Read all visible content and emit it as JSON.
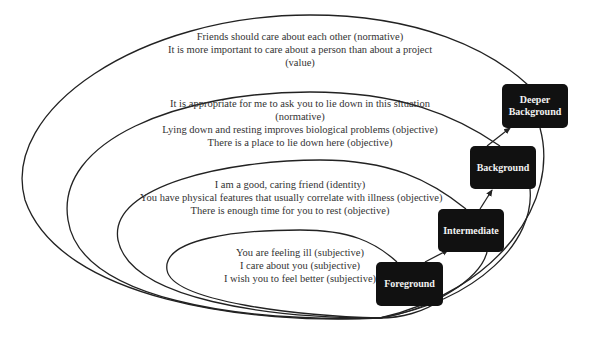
{
  "levels": [
    {
      "name": "Deeper Background",
      "label": "Deeper\nBackground",
      "label_line1": "Deeper",
      "label_line2": "Background",
      "statements": [
        "Friends should care about each other (normative)",
        "It is more important to care about a person than about a project",
        "(value)"
      ]
    },
    {
      "name": "Background",
      "label": "Background",
      "statements": [
        "It is appropriate for me to ask you to lie down in this situation",
        "(normative)",
        "Lying down and resting improves biological problems (objective)",
        "There is a place to lie down here (objective)"
      ]
    },
    {
      "name": "Intermediate",
      "label": "Intermediate",
      "statements": [
        "I am a good, caring friend (identity)",
        "You have physical features that usually correlate with illness (objective)",
        "There is enough time for you to rest (objective)"
      ]
    },
    {
      "name": "Foreground",
      "label": "Foreground",
      "statements": [
        "You are feeling ill (subjective)",
        "I care about you (subjective)",
        "I wish you to feel better (subjective)"
      ]
    }
  ],
  "colors": {
    "box_fill": "#111111",
    "box_text": "#f2f2f2",
    "line": "#222222",
    "text": "#333333"
  }
}
